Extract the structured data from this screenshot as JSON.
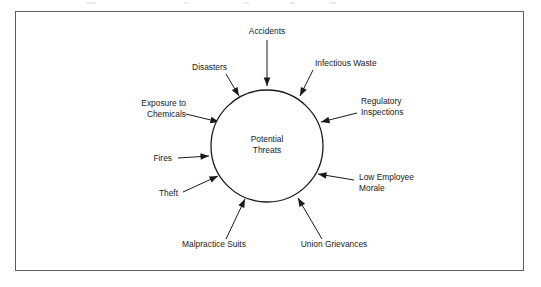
{
  "diagram": {
    "type": "hub-and-spoke",
    "hub": {
      "label_line_1": "Potential",
      "label_line_2": "Threats",
      "shape": "circle",
      "center_x": 267,
      "center_y": 146,
      "radius": 56
    },
    "colors": {
      "stroke": "#1a1a1a",
      "frame": "#5e5e5e",
      "background": "#ffffff",
      "text": "#1a1a1a"
    },
    "frame": {
      "x": 15,
      "y": 11,
      "width": 509,
      "height": 260
    },
    "nodes": [
      {
        "id": "accidents",
        "label_line_1": "Accidents",
        "label_line_2": "",
        "position": "top",
        "text_anchor": "middle",
        "text_x": 267,
        "text_y": 34,
        "line_x1": 267,
        "line_y1": 40,
        "line_x2": 267,
        "line_y2": 86,
        "arrow_angle": 90
      },
      {
        "id": "infectious-waste",
        "label_line_1": "Infectious Waste",
        "label_line_2": "",
        "position": "top-right",
        "text_anchor": "start",
        "text_x": 315,
        "text_y": 66,
        "line_x1": 313,
        "line_y1": 70,
        "line_x2": 300,
        "line_y2": 96,
        "arrow_angle": 117
      },
      {
        "id": "regulatory-inspections",
        "label_line_1": "Regulatory",
        "label_line_2": "Inspections",
        "position": "right-upper",
        "text_anchor": "start",
        "text_x": 361,
        "text_y": 104,
        "line_x1": 357,
        "line_y1": 113,
        "line_x2": 321,
        "line_y2": 122,
        "arrow_angle": 166
      },
      {
        "id": "low-employee-morale",
        "label_line_1": "Low Employee",
        "label_line_2": "Morale",
        "position": "right-lower",
        "text_anchor": "start",
        "text_x": 359,
        "text_y": 180,
        "line_x1": 354,
        "line_y1": 180,
        "line_x2": 318,
        "line_y2": 174,
        "arrow_angle": 189
      },
      {
        "id": "union-grievances",
        "label_line_1": "Union Grievances",
        "label_line_2": "",
        "position": "bottom-right",
        "text_anchor": "middle",
        "text_x": 334,
        "text_y": 247,
        "line_x1": 322,
        "line_y1": 239,
        "line_x2": 298,
        "line_y2": 198,
        "arrow_angle": 240
      },
      {
        "id": "malpractice-suits",
        "label_line_1": "Malpractice Suits",
        "label_line_2": "",
        "position": "bottom-left",
        "text_anchor": "middle",
        "text_x": 214,
        "text_y": 247,
        "line_x1": 226,
        "line_y1": 239,
        "line_x2": 245,
        "line_y2": 199,
        "arrow_angle": 296
      },
      {
        "id": "theft",
        "label_line_1": "Theft",
        "label_line_2": "",
        "position": "left-lower",
        "text_anchor": "end",
        "text_x": 178,
        "text_y": 196,
        "line_x1": 183,
        "line_y1": 192,
        "line_x2": 218,
        "line_y2": 176,
        "arrow_angle": 335
      },
      {
        "id": "fires",
        "label_line_1": "Fires",
        "label_line_2": "",
        "position": "left",
        "text_anchor": "end",
        "text_x": 172,
        "text_y": 161,
        "line_x1": 178,
        "line_y1": 158,
        "line_x2": 209,
        "line_y2": 156,
        "arrow_angle": 2
      },
      {
        "id": "exposure-to-chemicals",
        "label_line_1": "Exposure to",
        "label_line_2": "Chemicals",
        "position": "left-upper",
        "text_anchor": "end",
        "text_x": 186,
        "text_y": 106,
        "line_x1": 186,
        "line_y1": 114,
        "line_x2": 219,
        "line_y2": 122,
        "arrow_angle": 14
      },
      {
        "id": "disasters",
        "label_line_1": "Disasters",
        "label_line_2": "",
        "position": "top-left",
        "text_anchor": "end",
        "text_x": 227,
        "text_y": 70,
        "line_x1": 226,
        "line_y1": 74,
        "line_x2": 239,
        "line_y2": 96,
        "arrow_angle": 60
      }
    ]
  }
}
